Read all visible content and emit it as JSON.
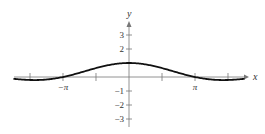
{
  "chart_data": {
    "type": "line",
    "title": "",
    "xlabel": "x",
    "ylabel": "y",
    "function": "sin(x)/x",
    "x_ticks": [
      {
        "value": -4.712,
        "label": ""
      },
      {
        "value": -3.1416,
        "label": "−π"
      },
      {
        "value": -1.5708,
        "label": ""
      },
      {
        "value": 1.5708,
        "label": ""
      },
      {
        "value": 3.1416,
        "label": "π"
      },
      {
        "value": 4.712,
        "label": ""
      }
    ],
    "y_ticks": [
      {
        "value": -3,
        "label": "−3"
      },
      {
        "value": -2,
        "label": "−2"
      },
      {
        "value": -1,
        "label": "−1"
      },
      {
        "value": 2,
        "label": "2"
      },
      {
        "value": 3,
        "label": "3"
      }
    ],
    "xlim": [
      -5.6,
      5.6
    ],
    "ylim": [
      -3.4,
      4.0
    ],
    "grid": false,
    "series": [
      {
        "name": "y = sin(x)/x",
        "x": [
          -5.5,
          -4.712,
          -3.9,
          -3.1416,
          -2.356,
          -1.5708,
          -0.785,
          0,
          0.785,
          1.5708,
          2.356,
          3.1416,
          3.9,
          4.712,
          5.5
        ],
        "y": [
          -0.128,
          -0.212,
          -0.177,
          0.0,
          0.3,
          0.637,
          0.9,
          1.0,
          0.9,
          0.637,
          0.3,
          0.0,
          -0.177,
          -0.212,
          -0.128
        ]
      }
    ]
  }
}
